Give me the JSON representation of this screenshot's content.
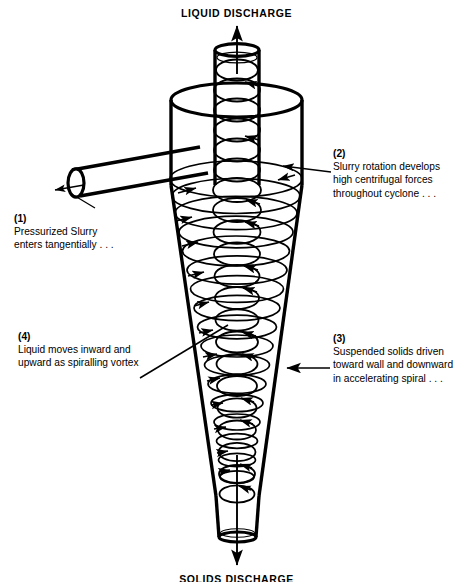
{
  "diagram": {
    "title_top": "LIQUID DISCHARGE",
    "title_bottom": "SOLIDS DISCHARGE"
  },
  "labels": {
    "top_discharge": "LIQUID DISCHARGE",
    "bottom_discharge": "SOLIDS DISCHARGE"
  },
  "callouts": [
    {
      "number": "(1)",
      "line1": "Pressurized Slurry",
      "line2": "enters tangentially . . .",
      "line3": "",
      "anchor": "feed-inlet-pipe"
    },
    {
      "number": "(2)",
      "line1": "Slurry rotation develops",
      "line2": "high centrifugal forces",
      "line3": "throughout cyclone . . .",
      "anchor": "cylindrical-body"
    },
    {
      "number": "(3)",
      "line1": "Suspended solids driven",
      "line2": "toward wall and downward",
      "line3": "in accelerating spiral . . .",
      "anchor": "cone-wall"
    },
    {
      "number": "(4)",
      "line1": "Liquid moves inward and",
      "line2": "upward as spiralling vortex",
      "line3": "",
      "anchor": "inner-vortex"
    }
  ],
  "parts": {
    "vortex_finder": "vortex-finder-pipe",
    "cylinder": "cylindrical-section",
    "cone": "conical-section",
    "apex": "apex-spigot",
    "inlet": "tangential-inlet-pipe"
  },
  "colors": {
    "stroke": "#000000",
    "background": "#ffffff"
  }
}
